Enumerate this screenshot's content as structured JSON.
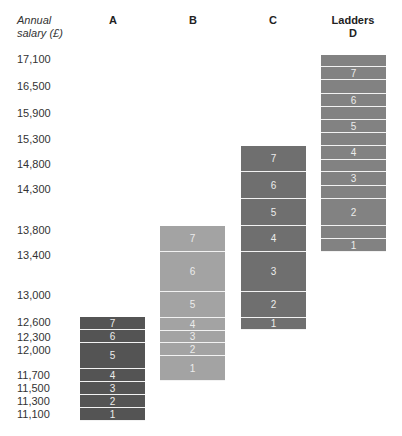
{
  "header": {
    "axis_label_line1": "Annual",
    "axis_label_line2": "salary (£)",
    "columns": [
      {
        "id": "A",
        "title": "",
        "label": "A"
      },
      {
        "id": "B",
        "title": "",
        "label": "B"
      },
      {
        "id": "C",
        "title": "",
        "label": "C"
      },
      {
        "id": "D",
        "title": "Ladders",
        "label": "D"
      }
    ]
  },
  "chart_data": {
    "type": "bar",
    "title": "Ladders",
    "ylabel": "Annual salary (£)",
    "y_ticks": [
      17100,
      16500,
      15900,
      15300,
      14800,
      14300,
      13800,
      13400,
      13000,
      12600,
      12300,
      12000,
      11700,
      11500,
      11300,
      11100
    ],
    "y_tick_labels": [
      "17,100",
      "16,500",
      "15,900",
      "15,300",
      "14,800",
      "14,300",
      "13,800",
      "13,400",
      "13,000",
      "12,600",
      "12,300",
      "12,000",
      "11,700",
      "11,500",
      "11,300",
      "11,100"
    ],
    "categories": [
      "A",
      "B",
      "C",
      "D"
    ],
    "colors": {
      "A": "#545454",
      "B": "#a3a3a3",
      "C": "#6f6f6f",
      "D": "#828282"
    },
    "ladders": [
      {
        "name": "A",
        "segments": [
          {
            "label": "1",
            "from": 11100,
            "to": 11300
          },
          {
            "label": "2",
            "from": 11300,
            "to": 11500
          },
          {
            "label": "3",
            "from": 11500,
            "to": 11700
          },
          {
            "label": "4",
            "from": 11700,
            "to": 11850
          },
          {
            "label": "5",
            "from": 11850,
            "to": 12300
          },
          {
            "label": "6",
            "from": 12300,
            "to": 12600
          },
          {
            "label": "7",
            "from": 12600,
            "to": 12800
          }
        ]
      },
      {
        "name": "B",
        "segments": [
          {
            "label": "1",
            "from": 11700,
            "to": 12000
          },
          {
            "label": "2",
            "from": 12000,
            "to": 12300
          },
          {
            "label": "3",
            "from": 12300,
            "to": 12600
          },
          {
            "label": "4",
            "from": 12600,
            "to": 12800
          },
          {
            "label": "5",
            "from": 12800,
            "to": 13200
          },
          {
            "label": "6",
            "from": 13200,
            "to": 13800
          },
          {
            "label": "7",
            "from": 13800,
            "to": 14050
          }
        ]
      },
      {
        "name": "C",
        "segments": [
          {
            "label": "1",
            "from": 12600,
            "to": 12800
          },
          {
            "label": "2",
            "from": 12800,
            "to": 13200
          },
          {
            "label": "3",
            "from": 13200,
            "to": 13800
          },
          {
            "label": "4",
            "from": 13800,
            "to": 14050
          },
          {
            "label": "5",
            "from": 14050,
            "to": 14550
          },
          {
            "label": "6",
            "from": 14550,
            "to": 15050
          },
          {
            "label": "7",
            "from": 15050,
            "to": 15550
          }
        ]
      },
      {
        "name": "D",
        "segments": [
          {
            "label": "1",
            "from": 13400,
            "to": 13600
          },
          {
            "label": "",
            "from": 13600,
            "to": 13800
          },
          {
            "label": "2",
            "from": 13800,
            "to": 14300
          },
          {
            "label": "",
            "from": 14300,
            "to": 14550
          },
          {
            "label": "3",
            "from": 14550,
            "to": 14800
          },
          {
            "label": "",
            "from": 14800,
            "to": 15050
          },
          {
            "label": "4",
            "from": 15050,
            "to": 15300
          },
          {
            "label": "",
            "from": 15300,
            "to": 15600
          },
          {
            "label": "5",
            "from": 15600,
            "to": 15900
          },
          {
            "label": "",
            "from": 15900,
            "to": 16200
          },
          {
            "label": "6",
            "from": 16200,
            "to": 16500
          },
          {
            "label": "",
            "from": 16500,
            "to": 16800
          },
          {
            "label": "7",
            "from": 16800,
            "to": 17100
          },
          {
            "label": "",
            "from": 17100,
            "to": 17350
          }
        ]
      }
    ]
  }
}
